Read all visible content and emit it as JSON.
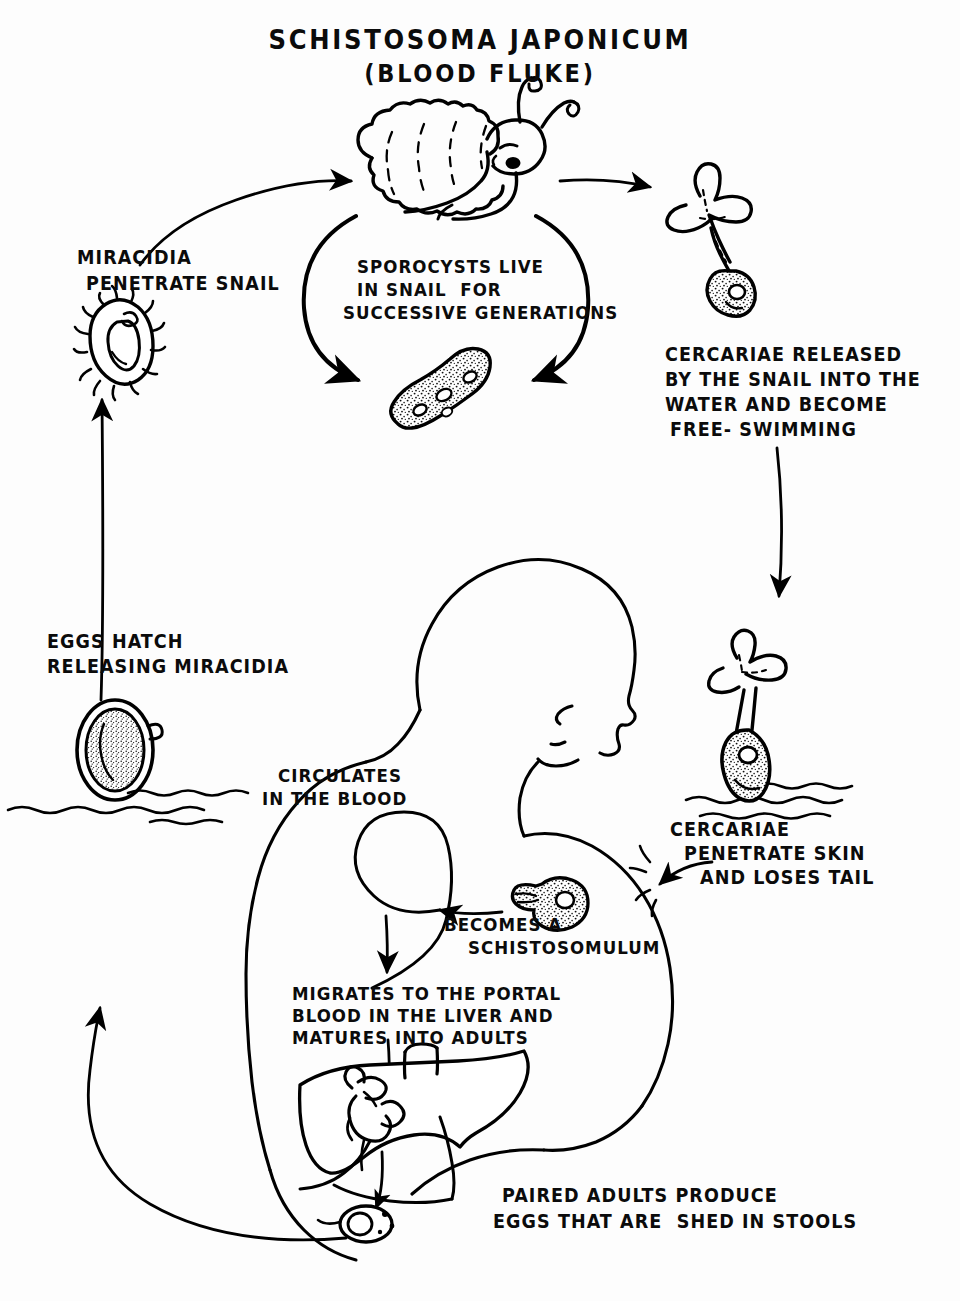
{
  "page": {
    "width": 960,
    "height": 1301,
    "background": "#ffffff",
    "ink": "#000000",
    "style": "hand-drawn black ink line art on white paper"
  },
  "title": {
    "line1": "SCHISTOSOMA JAPONICUM",
    "line2": "(BLOOD FLUKE)"
  },
  "labels": {
    "miracidia_penetrate_snail": {
      "line1": "MIRACIDIA",
      "line2": "PENETRATE SNAIL"
    },
    "sporocysts": {
      "line1": "SPOROCYSTS LIVE",
      "line2": "IN SNAIL  FOR",
      "line3": "SUCCESSIVE GENERATIONS"
    },
    "cercariae_released": {
      "line1": "CERCARIAE RELEASED",
      "line2": "BY THE SNAIL INTO THE",
      "line3": "WATER AND BECOME",
      "line4": "FREE- SWIMMING"
    },
    "eggs_hatch": {
      "line1": "EGGS HATCH",
      "line2": "RELEASING MIRACIDIA"
    },
    "circulates": {
      "line1": "CIRCULATES",
      "line2": "IN THE BLOOD"
    },
    "cercariae_penetrate": {
      "line1": "CERCARIAE",
      "line2": "PENETRATE SKIN",
      "line3": "AND LOSES TAIL"
    },
    "becomes_schistosomulum": {
      "line1": "BECOMES A",
      "line2": "SCHISTOSOMULUM"
    },
    "migrates_liver": {
      "line1": "MIGRATES TO THE PORTAL",
      "line2": "BLOOD IN THE LIVER AND",
      "line3": "MATURES INTO ADULTS"
    },
    "paired_adults": {
      "line1": "PAIRED ADULTS PRODUCE",
      "line2": "EGGS THAT ARE  SHED IN STOOLS"
    }
  },
  "figures": [
    {
      "name": "snail",
      "description": "snail with coiled shell, eyestalks and tentacles, at top center"
    },
    {
      "name": "cercaria-free-swimming",
      "description": "fork-tailed cercaria larva leaving the snail, top right"
    },
    {
      "name": "sporocyst",
      "description": "elongated stippled sporocyst inside snail cycle, below snail"
    },
    {
      "name": "miracidium",
      "description": "ciliated pear-shaped miracidium larva, upper left"
    },
    {
      "name": "egg",
      "description": "oval schistosome egg with lateral spine, left side above water"
    },
    {
      "name": "water-surface",
      "description": "wavy water lines, left side and right side"
    },
    {
      "name": "cercaria-in-water",
      "description": "fork-tailed cercaria swimming at water surface, right side"
    },
    {
      "name": "human-figure",
      "description": "outline of a human head, neck, shoulder, arm and torso in profile facing right"
    },
    {
      "name": "schistosomulum",
      "description": "stippled round schistosomulum that has lost its tail, in the shoulder area"
    },
    {
      "name": "liver",
      "description": "liver outline with portal vessel and paired adult flukes inside"
    },
    {
      "name": "intestine-egg-exit",
      "description": "egg being shed at the lower intestine / stool exit point"
    }
  ],
  "cycle_arrows": [
    {
      "name": "arrow-miracidia-to-snail",
      "from": "miracidium",
      "to": "snail"
    },
    {
      "name": "arrow-snail-to-cercaria",
      "from": "snail",
      "to": "cercaria-free-swimming"
    },
    {
      "name": "arrow-sporocyst-loop-right",
      "from": "snail",
      "to": "sporocyst"
    },
    {
      "name": "arrow-sporocyst-loop-left",
      "from": "sporocyst",
      "to": "snail"
    },
    {
      "name": "arrow-cercaria-down-to-water",
      "from": "cercariae-released-label",
      "to": "cercaria-in-water"
    },
    {
      "name": "arrow-cercaria-penetrates-skin",
      "from": "cercaria-in-water",
      "to": "human-shoulder"
    },
    {
      "name": "arrow-schistosomulum-to-blood",
      "from": "schistosomulum",
      "to": "circulates-in-blood"
    },
    {
      "name": "arrow-blood-to-liver",
      "from": "circulates-in-blood",
      "to": "liver"
    },
    {
      "name": "arrow-eggs-to-water",
      "from": "stool-exit",
      "to": "egg"
    },
    {
      "name": "arrow-egg-to-miracidium",
      "from": "egg",
      "to": "miracidium"
    }
  ]
}
